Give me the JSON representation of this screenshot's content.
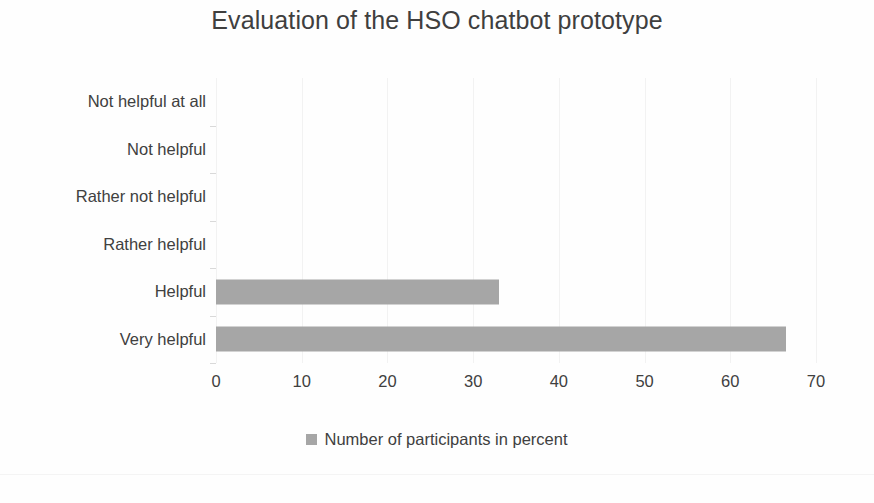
{
  "chart_data": {
    "type": "bar",
    "orientation": "horizontal",
    "title": "Evaluation of the HSO chatbot prototype",
    "xlabel": "",
    "ylabel": "",
    "categories": [
      "Not helpful at all",
      "Not helpful",
      "Rather not helpful",
      "Rather helpful",
      "Helpful",
      "Very helpful"
    ],
    "values": [
      0,
      0,
      0,
      0,
      33,
      66.5
    ],
    "series": [
      {
        "name": "Number of participants in percent",
        "values": [
          0,
          0,
          0,
          0,
          33,
          66.5
        ],
        "color": "#a6a6a6"
      }
    ],
    "xlim": [
      0,
      70
    ],
    "xticks": [
      0,
      10,
      20,
      30,
      40,
      50,
      60,
      70
    ],
    "xtick_labels": [
      "0",
      "10",
      "20",
      "30",
      "40",
      "50",
      "60",
      "70"
    ],
    "grid": "vertical-faint",
    "legend": {
      "position": "bottom-center",
      "entries": [
        {
          "label": "Number of participants in percent",
          "color": "#a6a6a6"
        }
      ]
    }
  },
  "colors": {
    "bar": "#a6a6a6",
    "text": "#404040",
    "gridline": "#f2f2f2",
    "background": "#fefefe"
  }
}
